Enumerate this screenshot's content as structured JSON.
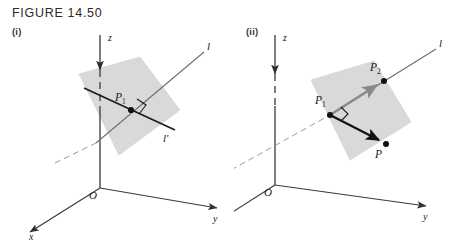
{
  "figure": {
    "title": "FIGURE 14.50",
    "colors": {
      "plane_fill": "#d9d9d9",
      "plane_stroke": "#cccccc",
      "axis_stroke": "#3a3a3a",
      "line_l_stroke": "#6e6e6e",
      "vector_black": "#111111",
      "vector_gray": "#8a8a8a",
      "text": "#1a1a1a",
      "background": "#ffffff"
    },
    "panels": [
      {
        "tag": "(i)",
        "axes": [
          {
            "name": "z",
            "label": "z"
          },
          {
            "name": "y",
            "label": "y"
          },
          {
            "name": "x",
            "label": "x"
          }
        ],
        "origin_label": "O",
        "lines": [
          {
            "name": "line-l",
            "label": "l"
          },
          {
            "name": "line-l-prime",
            "label": "l'"
          }
        ],
        "points": [
          {
            "name": "point-p1",
            "label": "P",
            "subscript": "1"
          }
        ],
        "markers": [
          {
            "name": "right-angle-marker",
            "label": ""
          }
        ],
        "plane": {
          "name": "plane-patch",
          "label": ""
        }
      },
      {
        "tag": "(ii)",
        "axes": [
          {
            "name": "z",
            "label": "z"
          },
          {
            "name": "y",
            "label": "y"
          },
          {
            "name": "x",
            "label": "x"
          }
        ],
        "origin_label": "O",
        "lines": [
          {
            "name": "line-l",
            "label": "l"
          }
        ],
        "points": [
          {
            "name": "point-p1",
            "label": "P",
            "subscript": "1"
          },
          {
            "name": "point-p2",
            "label": "P",
            "subscript": "2"
          },
          {
            "name": "point-p",
            "label": "P",
            "subscript": ""
          }
        ],
        "vectors": [
          {
            "name": "vector-p1-p2",
            "label": "",
            "color": "#8a8a8a"
          },
          {
            "name": "vector-p1-p",
            "label": "",
            "color": "#111111"
          }
        ],
        "markers": [
          {
            "name": "right-angle-marker",
            "label": ""
          }
        ],
        "plane": {
          "name": "plane-patch",
          "label": ""
        }
      }
    ]
  }
}
